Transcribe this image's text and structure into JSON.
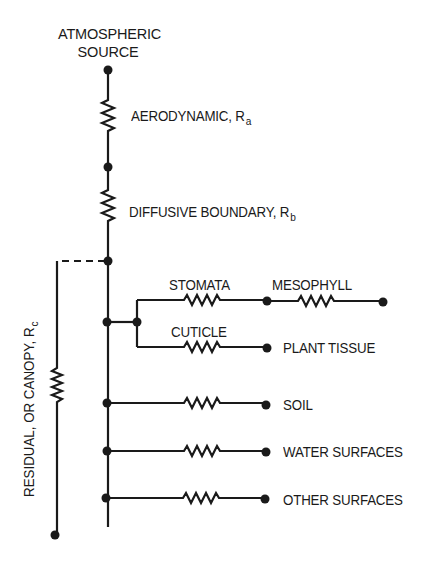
{
  "diagram": {
    "type": "resistance-network",
    "source": {
      "line1": "ATMOSPHERIC",
      "line2": "SOURCE"
    },
    "series_resistances": [
      {
        "id": "aerodynamic",
        "label": "AERODYNAMIC, R",
        "subscript": "a"
      },
      {
        "id": "diffusive-boundary",
        "label": "DIFFUSIVE BOUNDARY, R",
        "subscript": "b"
      }
    ],
    "canopy": {
      "label": "RESIDUAL, OR CANOPY, R",
      "subscript": "c"
    },
    "branches": [
      {
        "id": "stomata",
        "label": "STOMATA",
        "next": {
          "label": "MESOPHYLL"
        }
      },
      {
        "id": "cuticle",
        "label": "CUTICLE",
        "sink": "PLANT TISSUE"
      },
      {
        "id": "soil",
        "sink": "SOIL"
      },
      {
        "id": "water",
        "sink": "WATER SURFACES"
      },
      {
        "id": "other",
        "sink": "OTHER SURFACES"
      }
    ],
    "colors": {
      "line": "#1a1a1a",
      "background": "#ffffff"
    }
  }
}
